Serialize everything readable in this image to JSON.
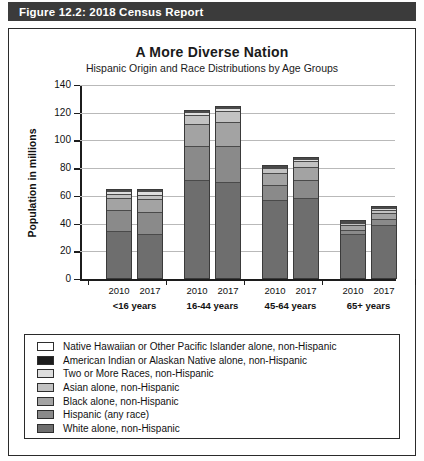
{
  "header": {
    "figure_label": "Figure 12.2: 2018 Census Report",
    "bar_color": "#3b3b3b"
  },
  "chart_data": {
    "type": "bar",
    "subtype": "stacked-bar-grouped",
    "title": "A More Diverse Nation",
    "subtitle": "Hispanic Origin and Race Distributions by Age Groups",
    "xlabel": "",
    "ylabel": "Population in millions",
    "ylim": [
      0,
      140
    ],
    "yticks": [
      0,
      20,
      40,
      60,
      80,
      100,
      120,
      140
    ],
    "ytick_labels": [
      "0",
      "20",
      "40",
      "60",
      "80",
      "100",
      "120",
      "140"
    ],
    "grid": true,
    "legend_position": "below-plot",
    "groups": [
      {
        "label": "<16 years",
        "years": [
          "2010",
          "2017"
        ]
      },
      {
        "label": "16-44 years",
        "years": [
          "2010",
          "2017"
        ]
      },
      {
        "label": "45-64 years",
        "years": [
          "2010",
          "2017"
        ]
      },
      {
        "label": "65+ years",
        "years": [
          "2010",
          "2017"
        ]
      }
    ],
    "categories": [
      "<16 years 2010",
      "<16 years 2017",
      "16-44 years 2010",
      "16-44 years 2017",
      "45-64 years 2010",
      "45-64 years 2017",
      "65+ years 2010",
      "65+ years 2017"
    ],
    "series": [
      {
        "name": "White alone, non-Hispanic",
        "color": "#6e6e6e",
        "values": [
          35.0,
          33.0,
          72.0,
          70.0,
          57.5,
          58.5,
          33.5,
          39.5
        ]
      },
      {
        "name": "Hispanic (any race)",
        "color": "#8a8a8a",
        "values": [
          15.0,
          15.5,
          24.0,
          26.5,
          11.0,
          13.5,
          3.0,
          4.5
        ]
      },
      {
        "name": "Black alone, non-Hispanic",
        "color": "#a3a3a3",
        "values": [
          9.0,
          9.5,
          16.5,
          17.5,
          8.5,
          9.5,
          3.5,
          4.5
        ]
      },
      {
        "name": "Asian alone, non-Hispanic",
        "color": "#c2c2c2",
        "values": [
          3.0,
          3.5,
          6.5,
          7.5,
          3.5,
          4.5,
          1.5,
          2.5
        ]
      },
      {
        "name": "Two or More Races, non-Hispanic",
        "color": "#dedede",
        "values": [
          2.0,
          2.5,
          2.0,
          2.5,
          1.0,
          1.5,
          0.5,
          1.0
        ]
      },
      {
        "name": "American Indian or Alaskan Native alone, non-Hispanic",
        "color": "#1c1c1c",
        "values": [
          0.6,
          0.6,
          0.8,
          0.9,
          0.6,
          0.7,
          0.3,
          0.4
        ]
      },
      {
        "name": "Native Hawaiian or Other Pacific Islander alone, non-Hispanic",
        "color": "#ffffff",
        "values": [
          0.3,
          0.3,
          0.3,
          0.3,
          0.2,
          0.2,
          0.1,
          0.1
        ]
      }
    ],
    "group_totals": [
      64.9,
      64.9,
      122.1,
      125.2,
      82.3,
      88.4,
      42.4,
      52.5
    ]
  },
  "legend": {
    "items": [
      {
        "label": "Native Hawaiian or Other Pacific Islander alone, non-Hispanic",
        "color": "#ffffff"
      },
      {
        "label": "American Indian or Alaskan Native alone, non-Hispanic",
        "color": "#1c1c1c"
      },
      {
        "label": "Two or More Races, non-Hispanic",
        "color": "#dedede"
      },
      {
        "label": "Asian alone, non-Hispanic",
        "color": "#c2c2c2"
      },
      {
        "label": "Black alone, non-Hispanic",
        "color": "#a3a3a3"
      },
      {
        "label": "Hispanic (any race)",
        "color": "#8a8a8a"
      },
      {
        "label": "White alone, non-Hispanic",
        "color": "#6e6e6e"
      }
    ]
  }
}
